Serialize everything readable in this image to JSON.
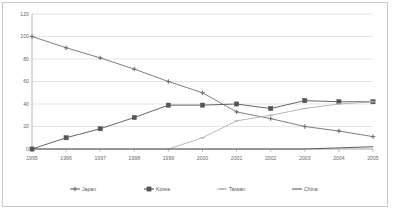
{
  "chart_data": {
    "type": "line",
    "title": "",
    "xlabel": "",
    "ylabel": "",
    "ylim": [
      0,
      120
    ],
    "yticks": [
      0,
      20,
      40,
      60,
      80,
      100,
      120
    ],
    "ytick_labels": [
      "0",
      "20",
      "40",
      "60",
      "80",
      "100",
      "120"
    ],
    "grid": "horizontal",
    "legend_position": "bottom",
    "categories": [
      "1995",
      "1996",
      "1997",
      "1998",
      "1999",
      "2000",
      "2001",
      "2002",
      "2003",
      "2004",
      "2005"
    ],
    "series": [
      {
        "name": "Japan",
        "color": "#6f6f6f",
        "marker": "cross",
        "values": [
          100,
          90,
          81,
          71,
          60,
          50,
          33,
          27,
          20,
          16,
          11
        ]
      },
      {
        "name": "Korea",
        "color": "#555555",
        "marker": "square",
        "values": [
          0,
          10,
          18,
          28,
          39,
          39,
          40,
          36,
          43,
          42,
          42
        ]
      },
      {
        "name": "Taiwan",
        "color": "#b0b0b0",
        "marker": "dash",
        "values": [
          null,
          null,
          null,
          null,
          0,
          10,
          25,
          30,
          36,
          40,
          42
        ]
      },
      {
        "name": "China",
        "color": "#5a5a5a",
        "marker": "none",
        "values": [
          0,
          0,
          0,
          0,
          0,
          0,
          0,
          0,
          0,
          1,
          2
        ]
      }
    ]
  },
  "legend": {
    "items": [
      {
        "label": "Japan"
      },
      {
        "label": "Korea"
      },
      {
        "label": "Taiwan"
      },
      {
        "label": "China"
      }
    ]
  }
}
